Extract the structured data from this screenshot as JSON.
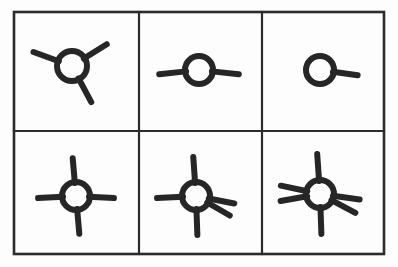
{
  "figure": {
    "background_color": "#fdfdfd",
    "line_color": "#2b2b2b",
    "glyph_color": "#262626",
    "frame": {
      "x": 14,
      "y": 12,
      "width": 370,
      "height": 242,
      "stroke_width": 2.6
    },
    "grid": {
      "rows": 2,
      "cols": 3,
      "vertical_dividers_x": [
        139,
        262
      ],
      "horizontal_dividers_y": [
        131
      ],
      "divider_stroke_width": 2.2
    }
  },
  "chart_data": {
    "type": "diagram",
    "rows": 2,
    "cols": 3,
    "cells": [
      {
        "index": 1,
        "row": 1,
        "col": 1,
        "label": "three-ray symbol",
        "ray_count": 3,
        "center": [
          72,
          66
        ],
        "radius": 15,
        "ray_angles_deg": [
          160,
          32,
          298
        ],
        "ray_length": 26,
        "stroke_width": 6
      },
      {
        "index": 2,
        "row": 1,
        "col": 2,
        "label": "two-ray symbol",
        "ray_count": 2,
        "center": [
          199,
          70
        ],
        "radius": 14,
        "ray_angles_deg": [
          186,
          354
        ],
        "ray_length": 26,
        "stroke_width": 6
      },
      {
        "index": 3,
        "row": 1,
        "col": 3,
        "label": "one-ray symbol",
        "ray_count": 1,
        "center": [
          320,
          70
        ],
        "radius": 14,
        "ray_angles_deg": [
          352
        ],
        "ray_length": 24,
        "stroke_width": 6
      },
      {
        "index": 4,
        "row": 2,
        "col": 1,
        "label": "four-ray symbol",
        "ray_count": 4,
        "center": [
          76,
          196
        ],
        "radius": 14,
        "ray_angles_deg": [
          95,
          183,
          275,
          357
        ],
        "ray_length": 24,
        "stroke_width": 6
      },
      {
        "index": 5,
        "row": 2,
        "col": 2,
        "label": "five-ray symbol",
        "ray_count": 5,
        "center": [
          196,
          196
        ],
        "radius": 14,
        "ray_angles_deg": [
          94,
          183,
          272,
          349,
          330
        ],
        "ray_length": 25,
        "stroke_width": 6
      },
      {
        "index": 6,
        "row": 2,
        "col": 3,
        "label": "six-ray symbol",
        "ray_count": 6,
        "center": [
          320,
          194
        ],
        "radius": 14,
        "ray_angles_deg": [
          94,
          272,
          168,
          190,
          352,
          332
        ],
        "ray_length": 26,
        "stroke_width": 6
      }
    ],
    "sequence_note": "Top row rays: 3, 2, 1. Bottom row rays: 4, 5, 6."
  }
}
